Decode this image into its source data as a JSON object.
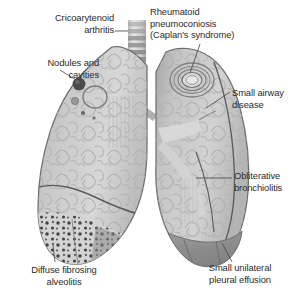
{
  "figure": {
    "width": 297,
    "height": 301,
    "background_color": "#ffffff"
  },
  "palette": {
    "lung_fill": "#c9c9c9",
    "lung_fill_light": "#d6d6d6",
    "lung_shadow": "#9a9a9a",
    "lung_outline": "#6e6e6e",
    "trachea_ring": "#9c9c9c",
    "trachea_gap": "#e3e3e3",
    "effusion_fill": "#8e8e8e",
    "stipple_dot": "#3a3a3a",
    "nodule_dark": "#4a4a4a",
    "leader_line": "#4a4a4a",
    "text_color": "#2b2b2b"
  },
  "annotations": [
    {
      "id": "cricoarytenoid",
      "lines": [
        "Cricoarytenoid",
        "arthritis"
      ],
      "align": "right",
      "points_to": "larynx-trachea-top"
    },
    {
      "id": "nodules",
      "lines": [
        "Nodules and",
        "cavities"
      ],
      "align": "right",
      "points_to": "left-lung-nodule"
    },
    {
      "id": "caplan",
      "lines": [
        "Rheumatoid",
        "pneumoconiosis",
        "(Caplan's syndrome)"
      ],
      "align": "left",
      "points_to": "right-lung-concentric-nodule"
    },
    {
      "id": "small_airway",
      "lines": [
        "Small airway",
        "disease"
      ],
      "align": "left",
      "points_to": "right-lung-upper-airways"
    },
    {
      "id": "obliterative",
      "lines": [
        "Obliterative",
        "bronchiolitis"
      ],
      "align": "left",
      "points_to": "right-lung-lower-bronchiole"
    },
    {
      "id": "alveolitis",
      "lines": [
        "Diffuse fibrosing",
        "alveolitis"
      ],
      "align": "center",
      "points_to": "left-lung-base-stippled-zone"
    },
    {
      "id": "effusion",
      "lines": [
        "Small unilateral",
        "pleural effusion"
      ],
      "align": "center",
      "points_to": "right-lung-base-effusion-wedge"
    }
  ],
  "anatomy": {
    "trachea": {
      "name": "trachea",
      "ring_count": 11
    },
    "left_lung": {
      "name": "left-lung",
      "features": [
        "nodule",
        "cavity",
        "fissure",
        "stippled-fibrosis-base"
      ]
    },
    "right_lung": {
      "name": "right-lung",
      "features": [
        "caplan-nodule",
        "hilum",
        "bronchi",
        "pleural-effusion"
      ]
    }
  }
}
